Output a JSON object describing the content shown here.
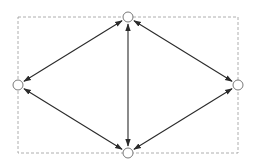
{
  "diagram": {
    "type": "graph",
    "width": 262,
    "height": 164,
    "background": "#ffffff",
    "frame": {
      "x": 18,
      "y": 17,
      "width": 220,
      "height": 136,
      "stroke": "#9a9a9a",
      "dash": "3,2"
    },
    "node_style": {
      "radius": 5,
      "fill": "#ffffff",
      "stroke": "#6a6a6a"
    },
    "edge_style": {
      "stroke": "#2b2b2b",
      "width": 1.1,
      "arrows": "both"
    },
    "nodes": [
      {
        "id": "top",
        "x": 128,
        "y": 17
      },
      {
        "id": "left",
        "x": 18,
        "y": 85
      },
      {
        "id": "right",
        "x": 238,
        "y": 85
      },
      {
        "id": "bottom",
        "x": 128,
        "y": 153
      }
    ],
    "edges": [
      {
        "from": "top",
        "to": "left",
        "bidirectional": true
      },
      {
        "from": "top",
        "to": "right",
        "bidirectional": true
      },
      {
        "from": "top",
        "to": "bottom",
        "bidirectional": true
      },
      {
        "from": "left",
        "to": "bottom",
        "bidirectional": true
      },
      {
        "from": "right",
        "to": "bottom",
        "bidirectional": true
      }
    ]
  }
}
